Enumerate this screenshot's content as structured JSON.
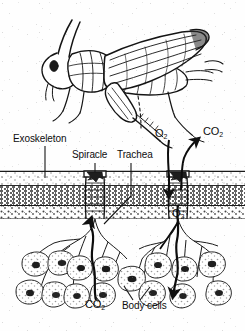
{
  "figure": {
    "ink_color": "#111111",
    "paper_color": "#fefefe"
  },
  "organism": {
    "name": "grasshopper",
    "view": "lateral line drawing"
  },
  "labels": {
    "exoskeleton": "Exoskeleton",
    "spiracle": "Spiracle",
    "trachea": "Trachea",
    "body_cells": "Body cells",
    "oxygen_top": "O",
    "oxygen_top_sub": "2",
    "carbon_dioxide_top": "CO",
    "carbon_dioxide_top_sub": "2",
    "oxygen_mid": "O",
    "oxygen_mid_sub": "2",
    "carbon_dioxide_bottom": "CO",
    "carbon_dioxide_bottom_sub": "2"
  },
  "body_wall": {
    "layers": [
      {
        "name": "cuticle-outer-line",
        "y": 172
      },
      {
        "name": "exocuticle-light-band",
        "y_top": 173,
        "y_bottom": 186
      },
      {
        "name": "endocuticle-dark-band",
        "y_top": 187,
        "y_bottom": 205
      },
      {
        "name": "epidermis-stipple-band",
        "y_top": 206,
        "y_bottom": 219
      }
    ]
  },
  "gas_flow": {
    "inward": "O2 enters through spiracle into tracheae to body cells",
    "outward": "CO2 exits from body cells through tracheae out the spiracle"
  }
}
